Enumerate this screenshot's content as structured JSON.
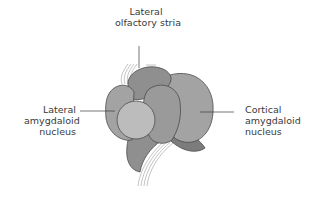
{
  "diagram": {
    "labels": {
      "top": [
        "Lateral",
        "olfactory stria"
      ],
      "left": [
        "Lateral",
        "amygdaloid",
        "nucleus"
      ],
      "right": [
        "Cortical",
        "amygdaloid",
        "nucleus"
      ]
    },
    "colors": {
      "background": "#ffffff",
      "lobe_dark": "#8f8f8f",
      "lobe_mid": "#a3a3a3",
      "lobe_light": "#bcbcbc",
      "lobe_shadow": "#7c7c7c",
      "outline": "#4a4a4a",
      "text": "#3a3a3a"
    }
  }
}
